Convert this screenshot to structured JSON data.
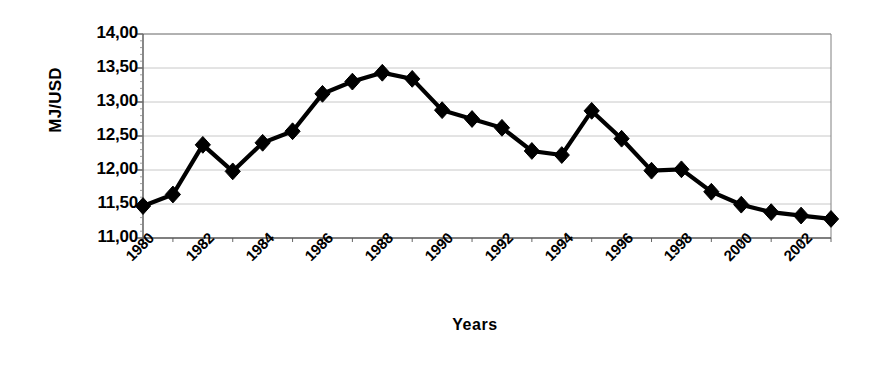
{
  "chart_data": {
    "type": "line",
    "title": "",
    "xlabel": "Years",
    "ylabel": "MJ/USD",
    "x": [
      1980,
      1981,
      1982,
      1983,
      1984,
      1985,
      1986,
      1987,
      1988,
      1989,
      1990,
      1991,
      1992,
      1993,
      1994,
      1995,
      1996,
      1997,
      1998,
      1999,
      2000,
      2001,
      2002,
      2003
    ],
    "values": [
      11.47,
      11.64,
      12.37,
      11.98,
      12.4,
      12.57,
      13.12,
      13.3,
      13.43,
      13.34,
      12.88,
      12.75,
      12.62,
      12.28,
      12.22,
      12.87,
      12.46,
      11.99,
      12.01,
      11.68,
      11.49,
      11.38,
      11.33,
      11.28
    ],
    "series": [
      {
        "name": "MJ/USD",
        "values": [
          11.47,
          11.64,
          12.37,
          11.98,
          12.4,
          12.57,
          13.12,
          13.3,
          13.43,
          13.34,
          12.88,
          12.75,
          12.62,
          12.28,
          12.22,
          12.87,
          12.46,
          11.99,
          12.01,
          11.68,
          11.49,
          11.38,
          11.33,
          11.28
        ]
      }
    ],
    "ylim": [
      11.0,
      14.0
    ],
    "ytick_values": [
      11.0,
      11.5,
      12.0,
      12.5,
      13.0,
      13.5,
      14.0
    ],
    "ytick_labels": [
      "11,00",
      "11,50",
      "12,00",
      "12,50",
      "13,00",
      "13,50",
      "14,00"
    ],
    "xtick_values": [
      1980,
      1982,
      1984,
      1986,
      1988,
      1990,
      1992,
      1994,
      1996,
      1998,
      2000,
      2002
    ],
    "xtick_labels": [
      "1980",
      "1982",
      "1984",
      "1986",
      "1988",
      "1990",
      "1992",
      "1994",
      "1996",
      "1998",
      "2000",
      "2002"
    ],
    "grid": "horizontal",
    "legend": "none",
    "marker": "diamond",
    "line_color": "#000000",
    "marker_color": "#000000",
    "grid_color": "#c8c8c8",
    "axis_color": "#808080",
    "background": "#ffffff"
  }
}
